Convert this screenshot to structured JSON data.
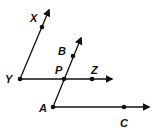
{
  "diagram": {
    "type": "geometry-rays",
    "stroke_color": "#111111",
    "background": "#ffffff",
    "points": [
      {
        "id": "X",
        "label": "X"
      },
      {
        "id": "Y",
        "label": "Y"
      },
      {
        "id": "B",
        "label": "B"
      },
      {
        "id": "P",
        "label": "P"
      },
      {
        "id": "Z",
        "label": "Z"
      },
      {
        "id": "A",
        "label": "A"
      },
      {
        "id": "C",
        "label": "C"
      }
    ],
    "rays": [
      {
        "name": "ray-YX",
        "from": "Y",
        "through": "X"
      },
      {
        "name": "ray-YZ",
        "from": "Y",
        "through": "Z"
      },
      {
        "name": "ray-AB",
        "from": "A",
        "through": "B"
      },
      {
        "name": "ray-AC",
        "from": "A",
        "through": "C"
      }
    ]
  }
}
